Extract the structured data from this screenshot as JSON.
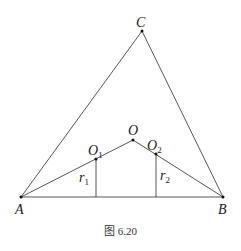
{
  "figure": {
    "caption": "图 6.20",
    "points": {
      "A": {
        "label": "A",
        "x": 21,
        "y": 197
      },
      "B": {
        "label": "B",
        "x": 223,
        "y": 197
      },
      "C": {
        "label": "C",
        "x": 142,
        "y": 31
      },
      "O": {
        "label": "O",
        "x": 133,
        "y": 140
      },
      "O1": {
        "label": "O",
        "sub": "1",
        "x": 96,
        "y": 159
      },
      "O2": {
        "label": "O",
        "sub": "2",
        "x": 156,
        "y": 154
      }
    },
    "radii": {
      "r1": {
        "label": "r",
        "sub": "1"
      },
      "r2": {
        "label": "r",
        "sub": "2"
      }
    }
  }
}
